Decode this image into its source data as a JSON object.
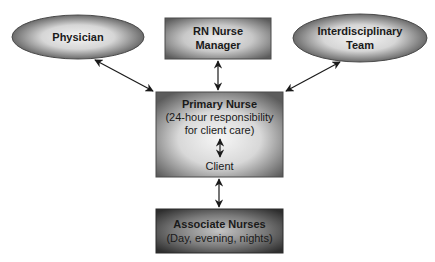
{
  "diagram": {
    "nodes": {
      "physician": {
        "label": "Physician",
        "shape": "ellipse"
      },
      "rn_manager": {
        "label_lines": [
          "RN Nurse",
          "Manager"
        ],
        "shape": "rectangle"
      },
      "interdisciplinary": {
        "label_lines": [
          "Interdisciplinary",
          "Team"
        ],
        "shape": "ellipse"
      },
      "primary_nurse": {
        "title": "Primary Nurse",
        "subtitle_lines": [
          "(24-hour responsibility",
          "for client care)"
        ],
        "inner_label": "Client",
        "shape": "rectangle"
      },
      "associate_nurses": {
        "title": "Associate Nurses",
        "subtitle": "(Day, evening, nights)",
        "shape": "rectangle"
      }
    },
    "edges": [
      {
        "from": "physician",
        "to": "primary_nurse",
        "direction": "both"
      },
      {
        "from": "rn_manager",
        "to": "primary_nurse",
        "direction": "both"
      },
      {
        "from": "interdisciplinary",
        "to": "primary_nurse",
        "direction": "both"
      },
      {
        "from": "primary_nurse",
        "to": "client",
        "direction": "both"
      },
      {
        "from": "primary_nurse",
        "to": "associate_nurses",
        "direction": "both"
      }
    ],
    "colors": {
      "node_edge": "#5a5a5a",
      "node_center": "#f2f2f2",
      "associate_edge": "#3a3a3a",
      "associate_center": "#bdbdbd",
      "arrow": "#1a1a1a"
    }
  }
}
